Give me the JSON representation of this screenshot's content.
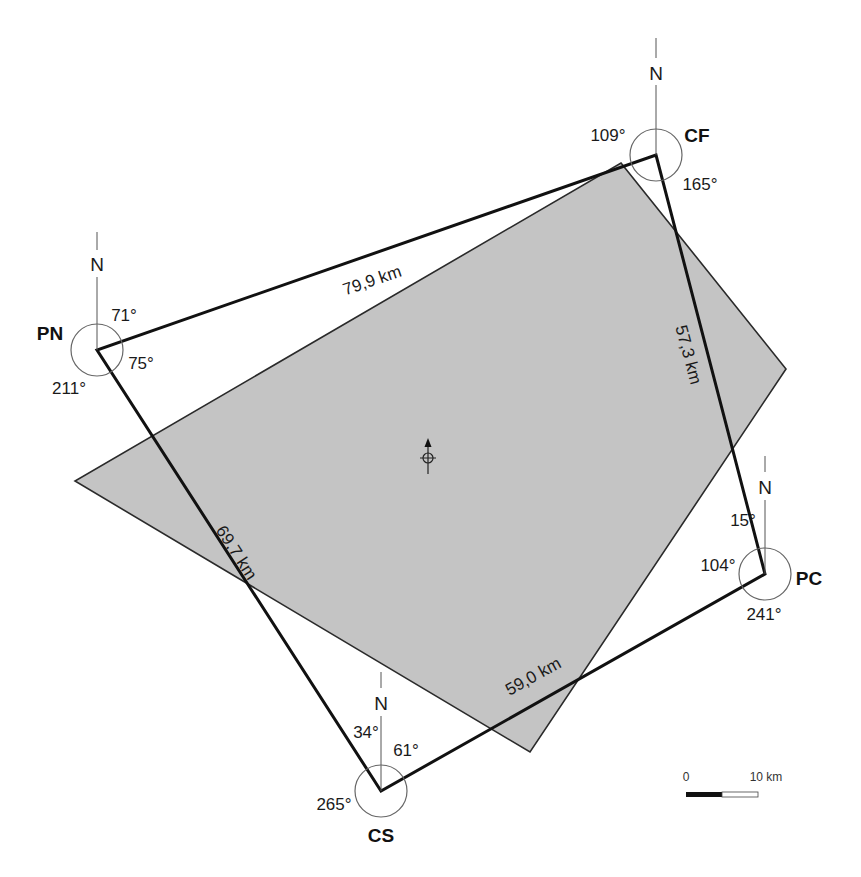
{
  "diagram": {
    "type": "survey-traverse-map",
    "colors": {
      "background": "#ffffff",
      "area_fill": "#c4c4c4",
      "area_stroke": "#2a2a2a",
      "traverse_stroke": "#111111",
      "thin_stroke": "#555555"
    },
    "stations": [
      {
        "id": "CF",
        "label": "CF",
        "angles": {
          "a1": "109°",
          "a2": "165°"
        },
        "north": "N"
      },
      {
        "id": "PN",
        "label": "PN",
        "angles": {
          "a1": "71°",
          "a2": "75°",
          "a3": "211°"
        },
        "north": "N"
      },
      {
        "id": "PC",
        "label": "PC",
        "angles": {
          "a1": "15°",
          "a2": "104°",
          "a3": "241°"
        },
        "north": "N"
      },
      {
        "id": "CS",
        "label": "CS",
        "angles": {
          "a1": "34°",
          "a2": "61°",
          "a3": "265°"
        },
        "north": "N"
      }
    ],
    "distances": {
      "pn_cf": "79,9 km",
      "cf_pc": "57,3 km",
      "pn_cs": "69,7 km",
      "cs_pc": "59,0 km"
    },
    "scale_bar": {
      "start_label": "0",
      "end_label": "10 km"
    },
    "center_marker": "north-arrow-crosshair"
  }
}
